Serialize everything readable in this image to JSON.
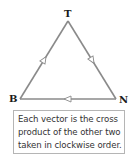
{
  "diagram": {
    "vertices": [
      {
        "id": "T",
        "label": "T",
        "x": 68,
        "y": 21
      },
      {
        "id": "B",
        "label": "B",
        "x": 20,
        "y": 99
      },
      {
        "id": "N",
        "label": "N",
        "x": 116,
        "y": 99
      }
    ],
    "edges": [
      {
        "from": "B",
        "to": "T",
        "arrow": "open",
        "direction": "toward-T"
      },
      {
        "from": "T",
        "to": "N",
        "arrow": "open",
        "direction": "toward-N"
      },
      {
        "from": "N",
        "to": "B",
        "arrow": "open",
        "direction": "toward-B"
      }
    ],
    "colors": {
      "edge": "#8a8a8a",
      "arrow_fill": "#ffffff",
      "label": "#1a1a1a",
      "caption_border": "#b5b5b5",
      "caption_text": "#333333"
    }
  },
  "caption": {
    "lines": [
      "Each vector is the cross",
      "product of the other two",
      "taken in clockwise order."
    ]
  }
}
